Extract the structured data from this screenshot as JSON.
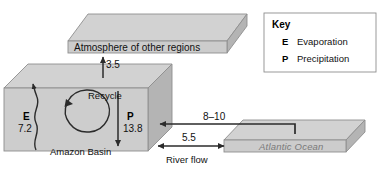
{
  "diagram": {
    "title_hidden": "",
    "boxes": {
      "atmosphere": {
        "label": "Atmosphere of other regions"
      },
      "basin": {
        "label": "Amazon Basin"
      },
      "ocean": {
        "label": "Atlantic Ocean"
      }
    },
    "flows": {
      "to_atmosphere": {
        "value": "3.5"
      },
      "evaporation": {
        "symbol": "E",
        "value": "7.2"
      },
      "precipitation": {
        "symbol": "P",
        "value": "13.8"
      },
      "recycle": {
        "label": "Recycle"
      },
      "ocean_to_basin": {
        "value": "8–10"
      },
      "river_flow": {
        "value": "5.5",
        "label": "River flow"
      }
    }
  },
  "key": {
    "title": "Key",
    "items": [
      {
        "symbol": "E",
        "label": "Evaporation"
      },
      {
        "symbol": "P",
        "label": "Precipitation"
      }
    ]
  },
  "colors": {
    "box_front": "#c9c9c9",
    "box_top": "#d6d6d6",
    "box_side": "#b6b6b6",
    "edge": "#8e8e8e",
    "arrow": "#2b2b2b",
    "ocean_text": "#7a7a7a"
  }
}
